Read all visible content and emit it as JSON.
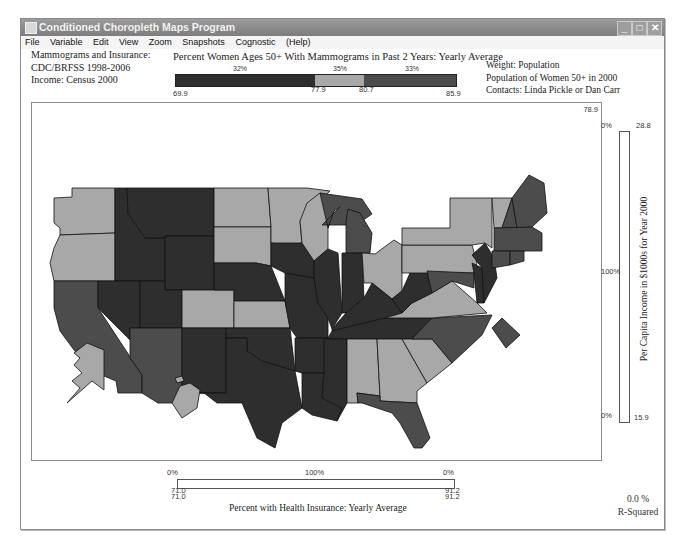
{
  "window": {
    "title": "Conditioned Choropleth Maps Program",
    "controls": {
      "minimize": "_",
      "maximize": "□",
      "close": "✕"
    }
  },
  "menu": [
    "File",
    "Variable",
    "Edit",
    "View",
    "Zoom",
    "Snapshots",
    "Cognostic",
    "(Help)"
  ],
  "info_left": {
    "line1": "Mammograms and Insurance:",
    "line2": "CDC/BRFSS 1998-2006",
    "line3": "Income: Census 2000"
  },
  "info_right": {
    "line1": "Weight: Population",
    "line2": "Population of Women 50+ in 2000",
    "line3": "Contacts:  Linda Pickle or Dan Carr"
  },
  "main_variable": {
    "title": "Percent Women Ages 50+ With Mammograms in Past 2 Years: Yearly Average",
    "segments": [
      {
        "pct": "32%",
        "color": "#2e2e2e"
      },
      {
        "pct": "35%",
        "color": "#a8a8a8"
      },
      {
        "pct": "33%",
        "color": "#4c4c4c"
      }
    ],
    "ticks": {
      "min": "69.9",
      "cut1": "77.9",
      "cut2": "80.7",
      "max": "85.9"
    }
  },
  "map": {
    "corner_value": "78.9",
    "colors": {
      "low": "#2e2e2e",
      "mid": "#a8a8a8",
      "high": "#4c4c4c",
      "border": "#111111"
    }
  },
  "vertical_slider": {
    "label": "Per Capita  Income in $1000s for Year 2000",
    "top_pct": "0%",
    "top_value": "28.8",
    "mid_pct": "100%",
    "bottom_pct": "0%",
    "bottom_value": "15.9"
  },
  "horizontal_slider": {
    "label": "Percent with Health Insurance: Yearly Average",
    "left_pct": "0%",
    "mid_pct": "100%",
    "right_pct": "0%",
    "left_value_a": "71.0",
    "left_value_b": "71.0",
    "right_value_a": "91.2",
    "right_value_b": "91.2"
  },
  "stats": {
    "r_squared_value": "0.0 %",
    "r_squared_label": "R-Squared"
  }
}
